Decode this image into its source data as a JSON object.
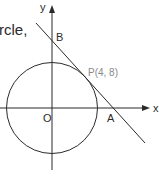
{
  "caption_fragment": "rcle,",
  "diagram": {
    "type": "coordinate-geometry",
    "axes": {
      "x_label": "x",
      "y_label": "y"
    },
    "origin_label": "O",
    "points": {
      "B": {
        "label": "B",
        "meaning": "tangent meets y-axis"
      },
      "P": {
        "label": "P(4, 8)",
        "x": 4,
        "y": 8,
        "meaning": "point of tangency on circle"
      },
      "A": {
        "label": "A",
        "meaning": "tangent meets x-axis"
      }
    },
    "circle": {
      "center": "O",
      "passes_through": "P(4, 8)"
    },
    "line": {
      "tangent_at": "P",
      "intercepts": [
        "A",
        "B"
      ]
    },
    "colors": {
      "stroke": "#2a2a2a",
      "point_label": "#8a8a8a"
    }
  }
}
